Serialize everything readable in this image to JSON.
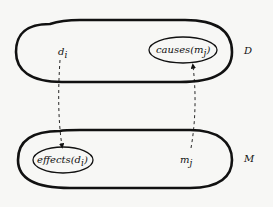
{
  "diagram": {
    "sets": [
      {
        "id": "D",
        "label": "D"
      },
      {
        "id": "M",
        "label": "M"
      }
    ],
    "nodes": {
      "d_i": "d",
      "d_i_sub": "i",
      "m_j": "m",
      "m_j_sub": "j",
      "causes": "causes(m",
      "causes_sub": "j",
      "causes_close": ")",
      "effects": "effects(d",
      "effects_sub": "i",
      "effects_close": ")"
    },
    "edges": [
      {
        "from": "d_i",
        "to": "effects(d_i)",
        "style": "dashed-arrow"
      },
      {
        "from": "m_j",
        "to": "causes(m_j)",
        "style": "dashed-arrow"
      }
    ],
    "colors": {
      "stroke": "#111111",
      "background": "#f7f7f5"
    }
  }
}
